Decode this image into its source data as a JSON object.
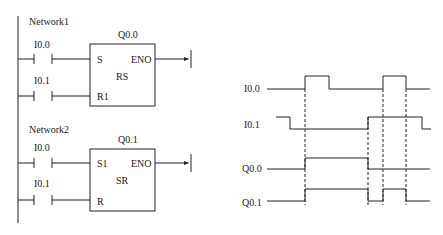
{
  "ladder": {
    "network1": {
      "title": "Network1",
      "contact1": "I0.0",
      "contact2": "I0.1",
      "output": "Q0.0",
      "block_type": "RS",
      "pin_set": "S",
      "pin_reset": "R1",
      "pin_out": "ENO"
    },
    "network2": {
      "title": "Network2",
      "contact1": "I0.0",
      "contact2": "I0.1",
      "output": "Q0.1",
      "block_type": "SR",
      "pin_set": "S1",
      "pin_reset": "R",
      "pin_out": "ENO"
    }
  },
  "timing": {
    "signals": [
      {
        "label": "I0.0"
      },
      {
        "label": "I0.1"
      },
      {
        "label": "Q0.0"
      },
      {
        "label": "Q0.1"
      }
    ]
  },
  "colors": {
    "line": "#222222",
    "background": "#ffffff"
  }
}
